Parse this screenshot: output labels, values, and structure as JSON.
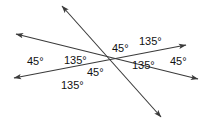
{
  "figure": {
    "background_color": "#ffffff",
    "line_color": "#3a3a3a",
    "text_color": "#111111",
    "lines": [
      {
        "name": "transversal-line",
        "from": {
          "x": 62,
          "y": 6
        },
        "to": {
          "x": 161,
          "y": 117
        },
        "arrowheads": [
          "start",
          "end"
        ]
      },
      {
        "name": "upper-parallel-line",
        "from": {
          "x": 14,
          "y": 78
        },
        "to": {
          "x": 186,
          "y": 45
        },
        "arrowheads": [
          "start",
          "end"
        ]
      },
      {
        "name": "lower-parallel-line",
        "from": {
          "x": 16,
          "y": 34
        },
        "to": {
          "x": 198,
          "y": 79
        },
        "arrowheads": [
          "start",
          "end"
        ]
      }
    ],
    "intersections": [
      {
        "name": "left-intersection",
        "x": 75,
        "y": 68
      },
      {
        "name": "right-intersection",
        "x": 152,
        "y": 48
      }
    ],
    "angle_labels": [
      {
        "id": "l-45-left",
        "value": "45°",
        "x": 27,
        "y": 55
      },
      {
        "id": "l-135-upleft",
        "value": "135°",
        "x": 64,
        "y": 54
      },
      {
        "id": "l-45-mid",
        "value": "45°",
        "x": 87,
        "y": 66
      },
      {
        "id": "l-135-bottom",
        "value": "135°",
        "x": 61,
        "y": 79
      },
      {
        "id": "l-45-upmid",
        "value": "45°",
        "x": 112,
        "y": 42
      },
      {
        "id": "l-135-topright",
        "value": "135°",
        "x": 139,
        "y": 35
      },
      {
        "id": "l-135-midright",
        "value": "135°",
        "x": 132,
        "y": 59
      },
      {
        "id": "l-45-right",
        "value": "45°",
        "x": 170,
        "y": 55
      }
    ]
  }
}
